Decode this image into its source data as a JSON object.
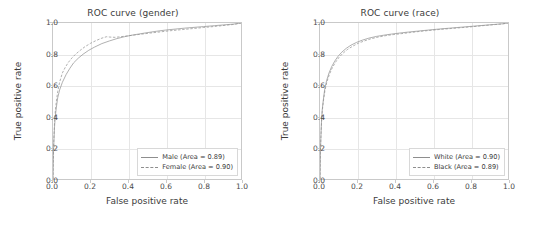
{
  "figure": {
    "background": "#ffffff",
    "grid_color": "#e6e6e6",
    "axis_color": "#c9c9c9",
    "curve_color": "#8e8e8e"
  },
  "panels": [
    {
      "key": "gender",
      "title": "ROC curve (gender)",
      "xlabel": "False positive rate",
      "ylabel": "True positive rate",
      "xticks": [
        "0.0",
        "0.2",
        "0.4",
        "0.6",
        "0.8",
        "1.0"
      ],
      "yticks": [
        "0.0",
        "0.2",
        "0.4",
        "0.6",
        "0.8",
        "1.0"
      ],
      "legend": [
        {
          "label": "Male (Area = 0.89)",
          "style": "solid"
        },
        {
          "label": "Female (Area = 0.90)",
          "style": "dashed"
        }
      ]
    },
    {
      "key": "race",
      "title": "ROC curve (race)",
      "xlabel": "False positive rate",
      "ylabel": "True positive rate",
      "xticks": [
        "0.0",
        "0.2",
        "0.4",
        "0.6",
        "0.8",
        "1.0"
      ],
      "yticks": [
        "0.0",
        "0.2",
        "0.4",
        "0.6",
        "0.8",
        "1.0"
      ],
      "legend": [
        {
          "label": "White (Area = 0.90)",
          "style": "solid"
        },
        {
          "label": "Black (Area = 0.89)",
          "style": "dashed"
        }
      ]
    }
  ],
  "chart_data": [
    {
      "type": "line",
      "title": "ROC curve (gender)",
      "xlabel": "False positive rate",
      "ylabel": "True positive rate",
      "xlim": [
        0.0,
        1.0
      ],
      "ylim": [
        0.0,
        1.0
      ],
      "xticks": [
        0.0,
        0.2,
        0.4,
        0.6,
        0.8,
        1.0
      ],
      "yticks": [
        0.0,
        0.2,
        0.4,
        0.6,
        0.8,
        1.0
      ],
      "grid": true,
      "legend_position": "lower right",
      "series": [
        {
          "name": "Male",
          "area": 0.89,
          "style": "solid",
          "x": [
            0.0,
            0.002,
            0.005,
            0.008,
            0.012,
            0.018,
            0.025,
            0.035,
            0.05,
            0.07,
            0.09,
            0.11,
            0.135,
            0.16,
            0.19,
            0.22,
            0.26,
            0.3,
            0.34,
            0.38,
            0.42,
            0.46,
            0.5,
            0.55,
            0.6,
            0.65,
            0.7,
            0.75,
            0.8,
            0.86,
            0.92,
            0.96,
            1.0
          ],
          "y": [
            0.0,
            0.15,
            0.25,
            0.33,
            0.4,
            0.46,
            0.52,
            0.57,
            0.62,
            0.67,
            0.71,
            0.745,
            0.775,
            0.8,
            0.825,
            0.845,
            0.868,
            0.885,
            0.9,
            0.912,
            0.922,
            0.93,
            0.938,
            0.947,
            0.955,
            0.961,
            0.967,
            0.972,
            0.977,
            0.983,
            0.989,
            0.993,
            1.0
          ]
        },
        {
          "name": "Female",
          "area": 0.9,
          "style": "dashed",
          "x": [
            0.0,
            0.002,
            0.005,
            0.008,
            0.012,
            0.018,
            0.025,
            0.035,
            0.05,
            0.065,
            0.08,
            0.1,
            0.12,
            0.145,
            0.17,
            0.2,
            0.23,
            0.26,
            0.285,
            0.3,
            0.33,
            0.36,
            0.4,
            0.44,
            0.48,
            0.52,
            0.57,
            0.62,
            0.68,
            0.74,
            0.8,
            0.87,
            0.93,
            0.97,
            1.0
          ],
          "y": [
            0.0,
            0.16,
            0.27,
            0.36,
            0.43,
            0.5,
            0.56,
            0.62,
            0.68,
            0.715,
            0.745,
            0.775,
            0.8,
            0.825,
            0.848,
            0.87,
            0.888,
            0.903,
            0.912,
            0.91,
            0.908,
            0.912,
            0.918,
            0.924,
            0.93,
            0.936,
            0.943,
            0.95,
            0.957,
            0.964,
            0.971,
            0.979,
            0.987,
            0.992,
            1.0
          ]
        }
      ]
    },
    {
      "type": "line",
      "title": "ROC curve (race)",
      "xlabel": "False positive rate",
      "ylabel": "True positive rate",
      "xlim": [
        0.0,
        1.0
      ],
      "ylim": [
        0.0,
        1.0
      ],
      "xticks": [
        0.0,
        0.2,
        0.4,
        0.6,
        0.8,
        1.0
      ],
      "yticks": [
        0.0,
        0.2,
        0.4,
        0.6,
        0.8,
        1.0
      ],
      "grid": true,
      "legend_position": "lower right",
      "series": [
        {
          "name": "White",
          "area": 0.9,
          "style": "solid",
          "x": [
            0.0,
            0.002,
            0.005,
            0.008,
            0.012,
            0.018,
            0.025,
            0.035,
            0.048,
            0.062,
            0.078,
            0.095,
            0.115,
            0.14,
            0.165,
            0.195,
            0.225,
            0.26,
            0.3,
            0.34,
            0.38,
            0.42,
            0.47,
            0.52,
            0.57,
            0.63,
            0.69,
            0.75,
            0.81,
            0.87,
            0.93,
            0.97,
            1.0
          ],
          "y": [
            0.0,
            0.17,
            0.28,
            0.37,
            0.445,
            0.51,
            0.575,
            0.63,
            0.68,
            0.72,
            0.755,
            0.785,
            0.812,
            0.838,
            0.858,
            0.876,
            0.89,
            0.903,
            0.914,
            0.922,
            0.929,
            0.935,
            0.942,
            0.948,
            0.954,
            0.961,
            0.967,
            0.973,
            0.979,
            0.985,
            0.991,
            0.995,
            1.0
          ]
        },
        {
          "name": "Black",
          "area": 0.89,
          "style": "dashed",
          "x": [
            0.0,
            0.002,
            0.005,
            0.008,
            0.012,
            0.018,
            0.026,
            0.036,
            0.05,
            0.065,
            0.082,
            0.1,
            0.122,
            0.148,
            0.175,
            0.205,
            0.238,
            0.272,
            0.31,
            0.35,
            0.392,
            0.435,
            0.482,
            0.53,
            0.58,
            0.64,
            0.7,
            0.76,
            0.818,
            0.875,
            0.932,
            0.972,
            1.0
          ],
          "y": [
            0.0,
            0.165,
            0.272,
            0.36,
            0.435,
            0.5,
            0.565,
            0.62,
            0.67,
            0.712,
            0.748,
            0.778,
            0.806,
            0.832,
            0.852,
            0.871,
            0.886,
            0.899,
            0.91,
            0.919,
            0.926,
            0.932,
            0.939,
            0.946,
            0.952,
            0.959,
            0.965,
            0.971,
            0.977,
            0.984,
            0.99,
            0.994,
            1.0
          ]
        }
      ]
    }
  ]
}
